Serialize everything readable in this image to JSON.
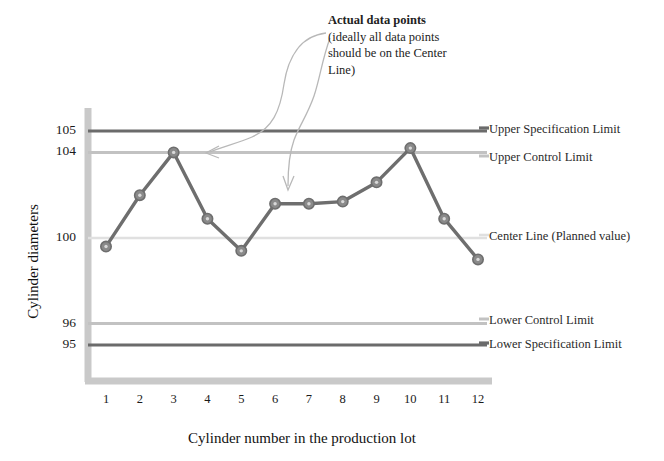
{
  "chart_data": {
    "type": "line",
    "title": "",
    "xlabel": "Cylinder number in the production lot",
    "ylabel": "Cylinder diameters",
    "categories": [
      "1",
      "2",
      "3",
      "4",
      "5",
      "6",
      "7",
      "8",
      "9",
      "10",
      "11",
      "12"
    ],
    "x": [
      1,
      2,
      3,
      4,
      5,
      6,
      7,
      8,
      9,
      10,
      11,
      12
    ],
    "series": [
      {
        "name": "Actual data points",
        "values": [
          99.6,
          102.0,
          104.0,
          100.9,
          99.4,
          101.6,
          101.6,
          101.7,
          102.6,
          104.2,
          100.9,
          99.0
        ]
      }
    ],
    "ylim": [
      93.5,
      106.5
    ],
    "xlim": [
      0.4,
      12.6
    ],
    "ytick_labels": [
      "105",
      "104",
      "100",
      "96",
      "95"
    ],
    "ytick_values": [
      105,
      104,
      100,
      96,
      95
    ],
    "grid": false,
    "legend_position": "right-inline",
    "reference_lines": [
      {
        "id": "usl",
        "value": 105,
        "label": "Upper Specification Limit",
        "color": "#6b6b6b",
        "width": 3.2
      },
      {
        "id": "ucl",
        "value": 104,
        "label": "Upper Control Limit",
        "color": "#c2c2c2",
        "width": 3.0
      },
      {
        "id": "cl",
        "value": 100,
        "label": "Center Line (Planned value)",
        "color": "#e0e0e0",
        "width": 2.6
      },
      {
        "id": "lcl",
        "value": 96,
        "label": "Lower Control Limit",
        "color": "#c2c2c2",
        "width": 3.0
      },
      {
        "id": "lsl",
        "value": 95,
        "label": "Lower Specification Limit",
        "color": "#6b6b6b",
        "width": 3.2
      }
    ],
    "annotations": [
      {
        "id": "actual-data-points",
        "title": "Actual data points",
        "body": "(ideally all data points should be on the Center Line)",
        "body_lines": [
          "(ideally all data points",
          "should be on the Center",
          "Line)"
        ],
        "points_to": [
          3,
          6
        ]
      }
    ],
    "series_color": "#6e6e6e",
    "marker_fill": "#8a8a8a",
    "axis_color": "#c9c9c9"
  },
  "axis": {
    "y_title": "Cylinder diameters",
    "x_title": "Cylinder number in the production lot"
  },
  "labels": {
    "usl": "Upper Specification Limit",
    "ucl": "Upper Control Limit",
    "cl": "Center Line (Planned value)",
    "lcl": "Lower Control Limit",
    "lsl": "Lower Specification Limit"
  },
  "annotation": {
    "title": "Actual data points",
    "line1": "(ideally all data points",
    "line2": "should be on the Center",
    "line3": "Line)"
  }
}
